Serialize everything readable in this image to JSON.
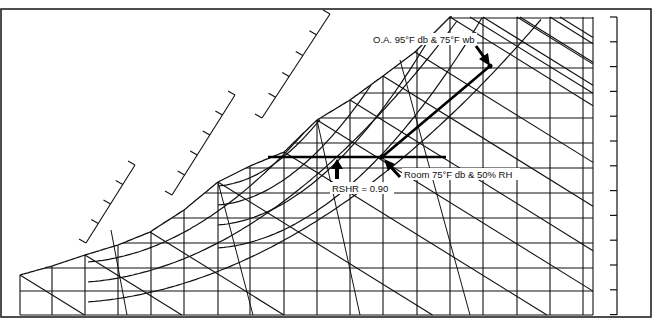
{
  "chart_data": {
    "type": "diagram",
    "title": "",
    "annotations": [
      {
        "id": "oa",
        "text": "O.A. 95°F db & 75°F wb",
        "point": [
          490,
          66
        ]
      },
      {
        "id": "room",
        "text": "Room 75°F db & 50% RH",
        "point": [
          382,
          157
        ]
      },
      {
        "id": "rshr",
        "text": "RSHR = 0.90",
        "point": [
          337,
          157
        ]
      }
    ],
    "process_lines": [
      {
        "name": "mixing/cooling line",
        "from": [
          382,
          157
        ],
        "to": [
          490,
          66
        ]
      },
      {
        "name": "RSHR line",
        "from": [
          268,
          157
        ],
        "to": [
          446,
          157
        ]
      }
    ],
    "grid": {
      "dry_bulb_x": [
        20,
        52,
        85,
        118,
        151,
        184,
        218,
        250,
        284,
        317,
        350,
        383,
        417,
        450,
        483,
        517,
        550,
        583
      ],
      "humidity_y": [
        18,
        43,
        68,
        93,
        118,
        143,
        168,
        193,
        218,
        243,
        268,
        291,
        315
      ]
    }
  },
  "labels": {
    "oa": "O.A. 95°F db & 75°F wb",
    "room": "Room 75°F db & 50% RH",
    "rshr": "RSHR = 0.90"
  }
}
